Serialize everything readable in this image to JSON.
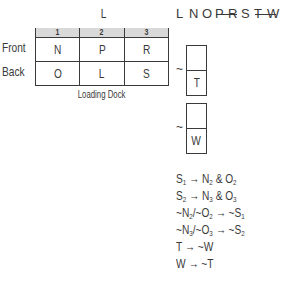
{
  "grid": {
    "title": "L",
    "columns": [
      "1",
      "2",
      "3"
    ],
    "rows": [
      {
        "label": "Front",
        "cells": [
          "N",
          "P",
          "R"
        ]
      },
      {
        "label": "Back",
        "cells": [
          "O",
          "L",
          "S"
        ]
      }
    ],
    "footer": "Loading Dock",
    "header_color": "#d9d9d9"
  },
  "letters": {
    "items": [
      "L",
      "N",
      "O",
      "P",
      "R",
      "S",
      "T",
      "W"
    ],
    "struck_pairs": [
      [
        "P",
        "R"
      ],
      [
        "T",
        "W"
      ]
    ]
  },
  "boxes": [
    {
      "prefix": "~",
      "top": "",
      "bottom": "T"
    },
    {
      "prefix": "~",
      "top": "",
      "bottom": "W"
    }
  ],
  "rules": [
    "S1 → N2 & O2",
    "S2 → N3 & O3",
    "~N2/~O2 → ~S1",
    "~N3/~O3 → ~S2",
    "T → ~W",
    "W → ~T"
  ],
  "rule_parts": {
    "r0": {
      "a": "S",
      "as": "1",
      "arrow": " → ",
      "b": "N",
      "bs": "2",
      "amp": " & ",
      "c": "O",
      "cs": "2"
    },
    "r1": {
      "a": "S",
      "as": "2",
      "arrow": " → ",
      "b": "N",
      "bs": "3",
      "amp": " & ",
      "c": "O",
      "cs": "3"
    },
    "r2": {
      "a": "~N",
      "as": "2",
      "sep": "/~O",
      "bs": "2",
      "arrow": " → ~S",
      "cs": "1"
    },
    "r3": {
      "a": "~N",
      "as": "3",
      "sep": "/~O",
      "bs": "3",
      "arrow": " → ~S",
      "cs": "2"
    },
    "r4": {
      "text": "T → ~W"
    },
    "r5": {
      "text": "W → ~T"
    }
  }
}
